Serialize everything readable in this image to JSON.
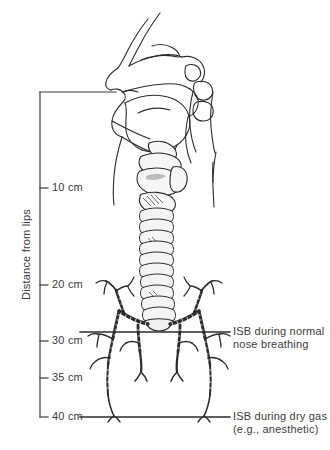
{
  "figure": {
    "background_color": "#ffffff",
    "line_color": "#2b2b2b",
    "text_color": "#3b3b3b"
  },
  "axis": {
    "name": "distance-scale",
    "title": "Distance from lips",
    "units": "cm",
    "origin_label": "0 cm",
    "range_cm": [
      0,
      40
    ],
    "ticks": [
      {
        "value": 10,
        "label": "10 cm",
        "y": 188
      },
      {
        "value": 20,
        "label": "20 cm",
        "y": 285
      },
      {
        "value": 30,
        "label": "30 cm",
        "y": 341
      },
      {
        "value": 35,
        "label": "35 cm",
        "y": 378
      },
      {
        "value": 40,
        "label": "40 cm",
        "y": 417
      }
    ]
  },
  "callouts": [
    {
      "name": "isb-normal-nose-breathing",
      "depth_cm": 30,
      "line_1": "ISB during normal",
      "line_2": "nose breathing",
      "marker_y": 332
    },
    {
      "name": "isb-dry-gas-anesthetic",
      "depth_cm": 40,
      "line_1": "ISB during dry gas",
      "line_2": "(e.g., anesthetic)",
      "marker_y": 417
    }
  ],
  "anatomy": {
    "structures": [
      "nasal-cavity",
      "hard-palate",
      "tongue",
      "oral-cavity",
      "pharynx",
      "epiglottis",
      "larynx",
      "trachea",
      "carina",
      "bronchial-tree",
      "neck-outline"
    ]
  }
}
